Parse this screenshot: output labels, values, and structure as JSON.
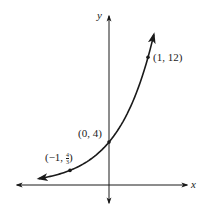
{
  "chart_data": {
    "type": "line",
    "title": "",
    "function": "y = 4 * 3^x",
    "xlabel": "x",
    "ylabel": "y",
    "grid": false,
    "legend": null,
    "points": [
      {
        "x": -1,
        "y": 1.3333,
        "label": "(−1, 4/3)"
      },
      {
        "x": 0,
        "y": 4,
        "label": "(0, 4)"
      },
      {
        "x": 1,
        "y": 12,
        "label": "(1, 12)"
      }
    ],
    "x": [
      -1.8,
      -1.5,
      -1,
      -0.5,
      0,
      0.5,
      1,
      1.15
    ],
    "values": [
      0.55,
      0.77,
      1.33,
      2.31,
      4,
      6.93,
      12,
      14.1
    ],
    "xlim": [
      -2.4,
      2.1
    ],
    "ylim": [
      -1.9,
      16.1
    ],
    "annotations": [
      "(−1, 4/3)",
      "(0, 4)",
      "(1, 12)"
    ]
  },
  "labels": {
    "x_axis": "x",
    "y_axis": "y",
    "p0": "(0, 4)",
    "p1": "(1, 12)",
    "pm1_prefix": "(−1, ",
    "pm1_num": "4",
    "pm1_den": "3",
    "pm1_suffix": ")"
  },
  "colors": {
    "ink": "#1a1a1a",
    "background": "#ffffff"
  }
}
